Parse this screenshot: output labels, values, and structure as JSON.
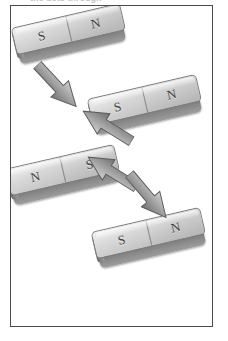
{
  "caption": {
    "text": "the dots through"
  },
  "figure": {
    "name": "magnet-rotation-diagram",
    "border_color": "#4a4a4a",
    "background": "#ffffff",
    "body_color_light": "#e9e9e9",
    "body_color_dark": "#6f6f6f",
    "label_color": "#3d3d3d",
    "arrow_color": "#8f8f8f"
  },
  "magnets": [
    {
      "id": "magnet-1",
      "position": "top-left",
      "left_pole": "S",
      "right_pole": "N",
      "x": 12,
      "y": 14,
      "rotation": -13
    },
    {
      "id": "magnet-2",
      "position": "upper-right",
      "left_pole": "S",
      "right_pole": "N",
      "x": 88,
      "y": 85,
      "rotation": -13
    },
    {
      "id": "magnet-3",
      "position": "lower-left",
      "left_pole": "N",
      "right_pole": "S",
      "x": 6,
      "y": 155,
      "rotation": -13
    },
    {
      "id": "magnet-4",
      "position": "bottom-right",
      "left_pole": "S",
      "right_pole": "N",
      "x": 92,
      "y": 218,
      "rotation": -13
    }
  ],
  "arrows": [
    {
      "id": "arrow-1",
      "direction": "down-right",
      "from": "magnet-1",
      "to": "magnet-2",
      "x": 27,
      "y": 72,
      "rotation": 47
    },
    {
      "id": "arrow-2",
      "direction": "up-left",
      "from": "magnet-2",
      "to": "magnet-3",
      "x": 77,
      "y": 112,
      "rotation": 212
    },
    {
      "id": "arrow-3",
      "direction": "up-left",
      "from": "magnet-3",
      "to": "magnet-2",
      "x": 82,
      "y": 158,
      "rotation": 212
    },
    {
      "id": "arrow-4",
      "direction": "down-right",
      "from": "magnet-3",
      "to": "magnet-4",
      "x": 118,
      "y": 182,
      "rotation": 50
    }
  ]
}
